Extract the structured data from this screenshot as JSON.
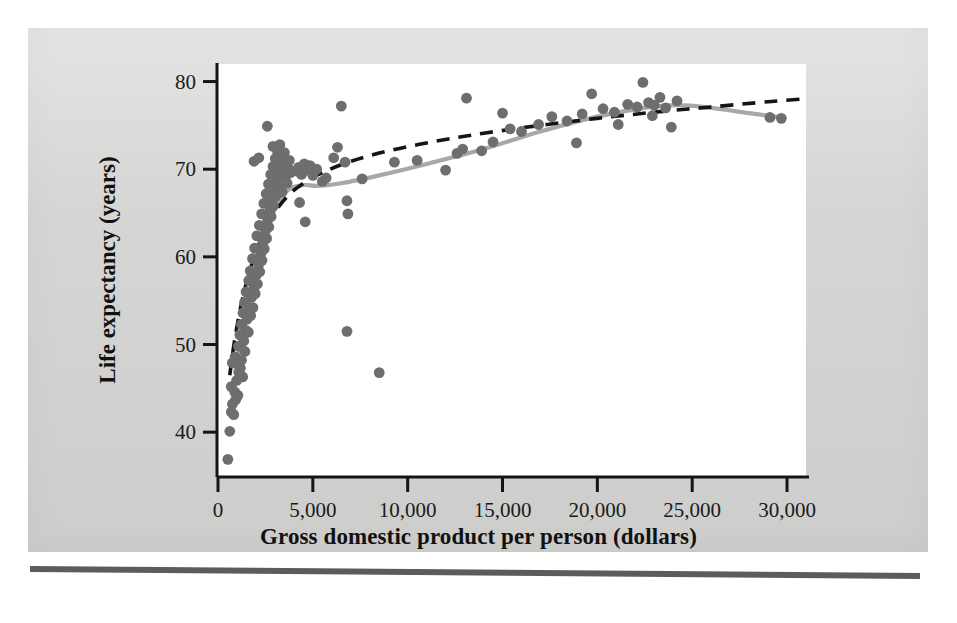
{
  "figure": {
    "xlabel": "Gross domestic product per person (dollars)",
    "ylabel": "Life expectancy (years)",
    "page_background": "#d8d8d6",
    "plot_background": "#ffffff",
    "point_color": "#6e6e6e",
    "lowess_color": "#a8a8a8",
    "logfit_color": "#151515"
  },
  "chart_data": {
    "type": "scatter",
    "title": "",
    "xlabel": "Gross domestic product per person (dollars)",
    "ylabel": "Life expectancy (years)",
    "xlim": [
      0,
      31000
    ],
    "ylim": [
      35,
      82
    ],
    "xticks": [
      0,
      5000,
      10000,
      15000,
      20000,
      25000,
      30000
    ],
    "xticklabels": [
      "0",
      "5,000",
      "10,000",
      "15,000",
      "20,000",
      "25,000",
      "30,000"
    ],
    "yticks": [
      40,
      50,
      60,
      70,
      80
    ],
    "yticklabels": [
      "40",
      "50",
      "60",
      "70",
      "80"
    ],
    "grid": false,
    "legend": false,
    "points": [
      [
        520,
        36.9
      ],
      [
        620,
        40.1
      ],
      [
        700,
        42.3
      ],
      [
        760,
        43.2
      ],
      [
        830,
        42.0
      ],
      [
        880,
        44.6
      ],
      [
        930,
        43.7
      ],
      [
        700,
        45.2
      ],
      [
        980,
        45.9
      ],
      [
        1050,
        44.2
      ],
      [
        1120,
        46.8
      ],
      [
        760,
        47.9
      ],
      [
        1180,
        47.3
      ],
      [
        900,
        48.6
      ],
      [
        1240,
        48.2
      ],
      [
        1300,
        46.3
      ],
      [
        1080,
        49.8
      ],
      [
        1360,
        50.4
      ],
      [
        1150,
        51.1
      ],
      [
        1420,
        49.2
      ],
      [
        1480,
        51.6
      ],
      [
        1240,
        52.3
      ],
      [
        1540,
        52.9
      ],
      [
        1600,
        51.4
      ],
      [
        1320,
        53.6
      ],
      [
        1660,
        54.1
      ],
      [
        1400,
        54.8
      ],
      [
        1720,
        53.3
      ],
      [
        1780,
        55.4
      ],
      [
        1480,
        56.0
      ],
      [
        1840,
        54.2
      ],
      [
        1900,
        56.6
      ],
      [
        1620,
        57.3
      ],
      [
        1960,
        55.8
      ],
      [
        2020,
        57.9
      ],
      [
        1700,
        58.4
      ],
      [
        2080,
        56.9
      ],
      [
        2140,
        59.1
      ],
      [
        1820,
        59.8
      ],
      [
        2200,
        58.3
      ],
      [
        2260,
        60.4
      ],
      [
        1930,
        61.0
      ],
      [
        2320,
        59.6
      ],
      [
        2380,
        61.7
      ],
      [
        2050,
        62.4
      ],
      [
        2440,
        60.9
      ],
      [
        2500,
        63.0
      ],
      [
        2180,
        63.6
      ],
      [
        2560,
        62.1
      ],
      [
        2620,
        64.2
      ],
      [
        2300,
        64.9
      ],
      [
        2680,
        63.4
      ],
      [
        2740,
        65.3
      ],
      [
        2420,
        66.1
      ],
      [
        2800,
        64.6
      ],
      [
        2860,
        66.6
      ],
      [
        2540,
        67.2
      ],
      [
        2920,
        65.8
      ],
      [
        2980,
        67.8
      ],
      [
        2660,
        68.3
      ],
      [
        3040,
        66.9
      ],
      [
        3100,
        68.8
      ],
      [
        2780,
        69.4
      ],
      [
        3160,
        68.0
      ],
      [
        3220,
        69.8
      ],
      [
        2900,
        70.3
      ],
      [
        3280,
        69.1
      ],
      [
        3340,
        70.7
      ],
      [
        3020,
        71.2
      ],
      [
        3400,
        70.0
      ],
      [
        3460,
        71.6
      ],
      [
        3140,
        72.0
      ],
      [
        3520,
        70.9
      ],
      [
        3580,
        69.2
      ],
      [
        3260,
        72.8
      ],
      [
        3640,
        68.4
      ],
      [
        3700,
        70.1
      ],
      [
        3380,
        67.4
      ],
      [
        3760,
        71.0
      ],
      [
        3820,
        69.6
      ],
      [
        1900,
        70.9
      ],
      [
        2150,
        71.3
      ],
      [
        2600,
        74.9
      ],
      [
        2900,
        72.6
      ],
      [
        3500,
        71.9
      ],
      [
        4100,
        69.8
      ],
      [
        4250,
        70.2
      ],
      [
        4400,
        69.4
      ],
      [
        4550,
        70.6
      ],
      [
        4700,
        69.9
      ],
      [
        4850,
        70.4
      ],
      [
        5000,
        69.3
      ],
      [
        5200,
        70.0
      ],
      [
        4300,
        66.2
      ],
      [
        4600,
        64.0
      ],
      [
        5500,
        68.6
      ],
      [
        5700,
        69.0
      ],
      [
        6100,
        71.3
      ],
      [
        6300,
        72.5
      ],
      [
        6500,
        77.2
      ],
      [
        6700,
        70.8
      ],
      [
        6800,
        66.4
      ],
      [
        6850,
        64.9
      ],
      [
        6800,
        51.5
      ],
      [
        8500,
        46.8
      ],
      [
        7600,
        68.9
      ],
      [
        9300,
        70.8
      ],
      [
        10500,
        71.0
      ],
      [
        12000,
        69.9
      ],
      [
        12600,
        71.8
      ],
      [
        13100,
        78.1
      ],
      [
        12900,
        72.3
      ],
      [
        14500,
        73.1
      ],
      [
        15400,
        74.6
      ],
      [
        16000,
        74.3
      ],
      [
        16900,
        75.1
      ],
      [
        17600,
        76.0
      ],
      [
        18400,
        75.5
      ],
      [
        19200,
        76.3
      ],
      [
        19700,
        78.6
      ],
      [
        20300,
        76.9
      ],
      [
        20900,
        76.5
      ],
      [
        21100,
        75.1
      ],
      [
        21600,
        77.4
      ],
      [
        22100,
        77.1
      ],
      [
        22400,
        79.9
      ],
      [
        22700,
        77.6
      ],
      [
        23000,
        77.3
      ],
      [
        23300,
        78.2
      ],
      [
        23600,
        77.0
      ],
      [
        23900,
        74.8
      ],
      [
        24200,
        77.8
      ],
      [
        29100,
        75.9
      ],
      [
        29700,
        75.8
      ],
      [
        18900,
        73.0
      ],
      [
        13900,
        72.1
      ],
      [
        15000,
        76.4
      ],
      [
        22900,
        76.1
      ]
    ],
    "curves": [
      {
        "name": "lowess-smooth",
        "style": "solid",
        "color": "#a8a8a8",
        "points": [
          [
            900,
            46.8
          ],
          [
            1400,
            52.0
          ],
          [
            1900,
            57.0
          ],
          [
            2400,
            61.4
          ],
          [
            2900,
            65.0
          ],
          [
            3400,
            67.0
          ],
          [
            3900,
            67.9
          ],
          [
            4600,
            68.2
          ],
          [
            5200,
            68.1
          ],
          [
            6500,
            68.4
          ],
          [
            8500,
            69.3
          ],
          [
            11000,
            70.6
          ],
          [
            14000,
            72.3
          ],
          [
            17000,
            74.3
          ],
          [
            20000,
            76.0
          ],
          [
            22500,
            77.0
          ],
          [
            24200,
            77.3
          ],
          [
            26000,
            77.0
          ],
          [
            28000,
            76.4
          ],
          [
            29800,
            75.9
          ]
        ]
      },
      {
        "name": "log-fit",
        "style": "dashed",
        "color": "#151515",
        "points": [
          [
            620,
            46.5
          ],
          [
            900,
            50.8
          ],
          [
            1300,
            55.3
          ],
          [
            1800,
            59.3
          ],
          [
            2400,
            62.7
          ],
          [
            3000,
            65.1
          ],
          [
            3700,
            67.0
          ],
          [
            4500,
            68.4
          ],
          [
            5500,
            69.6
          ],
          [
            7000,
            70.9
          ],
          [
            9000,
            72.1
          ],
          [
            11500,
            73.2
          ],
          [
            14000,
            74.1
          ],
          [
            17000,
            75.0
          ],
          [
            20000,
            75.8
          ],
          [
            23000,
            76.5
          ],
          [
            26000,
            77.1
          ],
          [
            29000,
            77.7
          ],
          [
            30800,
            78.0
          ]
        ]
      }
    ]
  }
}
